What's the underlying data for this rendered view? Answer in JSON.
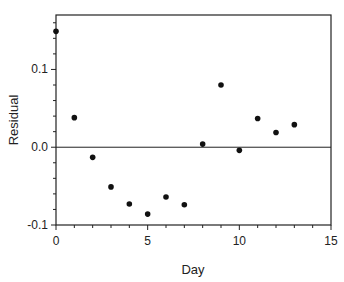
{
  "chart_data": {
    "type": "scatter",
    "title": "",
    "xlabel": "Day",
    "ylabel": "Residual",
    "xlim": [
      0,
      15
    ],
    "ylim": [
      -0.1,
      0.17
    ],
    "xticks": [
      0,
      5,
      10,
      15
    ],
    "xtick_labels": [
      "0",
      "5",
      "10",
      "15"
    ],
    "yticks": [
      -0.1,
      0.0,
      0.1
    ],
    "ytick_labels": [
      "-0.1",
      "0.0",
      "0.1"
    ],
    "x_minor_step": 1,
    "y_minor_step": 0.02,
    "reference_line_y": 0.0,
    "grid": false,
    "series": [
      {
        "name": "Residuals",
        "color": "#111111",
        "x": [
          0,
          1,
          2,
          3,
          4,
          5,
          6,
          7,
          8,
          9,
          10,
          11,
          12,
          13
        ],
        "y": [
          0.149,
          0.038,
          -0.013,
          -0.051,
          -0.073,
          -0.086,
          -0.064,
          -0.074,
          0.004,
          0.08,
          -0.004,
          0.037,
          0.019,
          0.029
        ]
      }
    ]
  }
}
